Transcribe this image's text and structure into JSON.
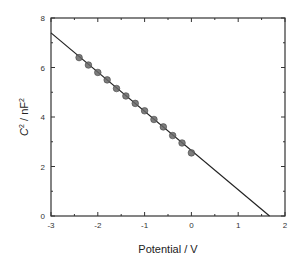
{
  "chart_data": {
    "type": "scatter",
    "title": "",
    "xlabel": "Potential / V",
    "ylabel_parts": {
      "var": "C",
      "sup1": "2",
      "mid": " / nF",
      "sup2": "2"
    },
    "xlim": [
      -3,
      2
    ],
    "ylim": [
      0,
      8
    ],
    "x_ticks": [
      -3,
      -2,
      -1,
      0,
      1,
      2
    ],
    "y_ticks": [
      0,
      2,
      4,
      6,
      8
    ],
    "x_tick_labels": [
      "-3",
      "-2",
      "-1",
      "0",
      "1",
      "2"
    ],
    "y_tick_labels": [
      "0",
      "2",
      "4",
      "6",
      "8"
    ],
    "x_minor_step": 0.5,
    "y_minor_step": 1,
    "grid": false,
    "legend": "none",
    "series": [
      {
        "name": "measured",
        "marker": "circle",
        "color": "#666666",
        "x": [
          -2.4,
          -2.2,
          -2.0,
          -1.8,
          -1.6,
          -1.4,
          -1.2,
          -1.0,
          -0.8,
          -0.6,
          -0.4,
          -0.2,
          0.0
        ],
        "y": [
          6.4,
          6.1,
          5.8,
          5.5,
          5.15,
          4.85,
          4.55,
          4.25,
          3.9,
          3.6,
          3.25,
          2.95,
          2.55
        ]
      }
    ],
    "fit_line": {
      "name": "linear fit",
      "color": "#222222",
      "x": [
        -3,
        1.67
      ],
      "y": [
        7.4,
        0
      ]
    }
  }
}
